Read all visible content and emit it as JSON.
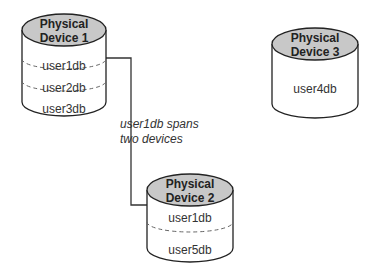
{
  "diagram": {
    "devices": [
      {
        "id": "pd1",
        "title_line1": "Physical",
        "title_line2": "Device 1",
        "segments": [
          "user1db",
          "user2db",
          "user3db"
        ]
      },
      {
        "id": "pd2",
        "title_line1": "Physical",
        "title_line2": "Device 2",
        "segments": [
          "user1db",
          "user5db"
        ]
      },
      {
        "id": "pd3",
        "title_line1": "Physical",
        "title_line2": "Device 3",
        "segments": [
          "user4db"
        ]
      }
    ],
    "annotation": {
      "line1": "user1db spans",
      "line2": "two devices"
    },
    "colors": {
      "cap_fill": "#c8c8c8",
      "stroke": "#222222",
      "body_fill": "#ffffff",
      "dash": "#666666"
    }
  }
}
